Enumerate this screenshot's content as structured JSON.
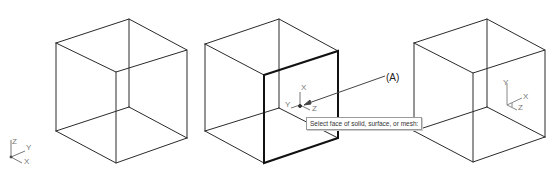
{
  "viewport": {
    "background": "#ffffff",
    "line_color": "#2a2a2a",
    "highlight_color": "#111111"
  },
  "cubes": [
    {
      "name": "cube-original",
      "state": "wireframe"
    },
    {
      "name": "cube-face-selected",
      "state": "front face highlighted"
    },
    {
      "name": "cube-ucs-aligned",
      "state": "wireframe with UCS on face"
    }
  ],
  "ucs_icons": [
    {
      "name": "world-ucs",
      "axes": [
        "Z",
        "Y",
        "X"
      ]
    },
    {
      "name": "face-ucs-dynamic",
      "axes": [
        "X",
        "Y",
        "Z"
      ]
    },
    {
      "name": "face-ucs-result",
      "axes": [
        "Y",
        "X",
        "Z"
      ]
    }
  ],
  "callout": {
    "label": "(A)"
  },
  "tooltip": {
    "text": "Select face of solid, surface, or mesh:"
  }
}
